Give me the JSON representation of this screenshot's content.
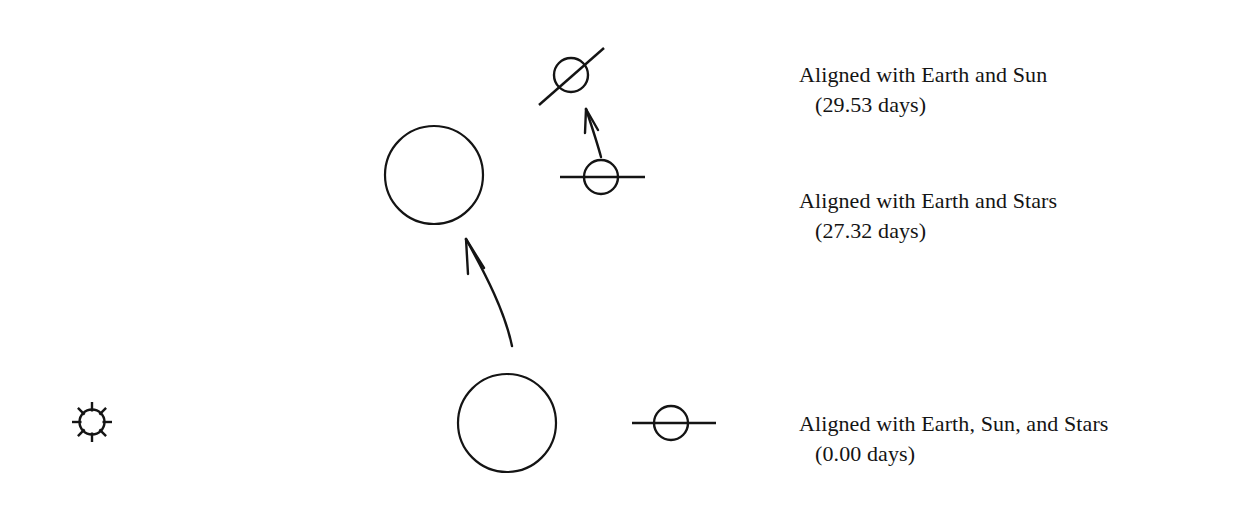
{
  "figure": {
    "background_color": "#ffffff",
    "stroke_color": "#141414"
  },
  "labels": {
    "synodic": {
      "line1": "Aligned with Earth and Sun",
      "line2": "(29.53 days)",
      "days": "29.53"
    },
    "sidereal": {
      "line1": "Aligned with Earth and Stars",
      "line2": "(27.32 days)",
      "days": "27.32"
    },
    "start": {
      "line1": "Aligned with Earth, Sun, and Stars",
      "line2": "(0.00 days)",
      "days": "0.00"
    }
  },
  "bodies": {
    "sun": {
      "name": "Sun",
      "cx": 92,
      "cy": 422,
      "r": 13,
      "rays": 8
    },
    "earth_start": {
      "name": "Earth at start",
      "cx": 507,
      "cy": 423,
      "r": 49
    },
    "earth_later": {
      "name": "Earth one month later",
      "cx": 434,
      "cy": 175,
      "r": 49
    },
    "moon_start": {
      "name": "Moon aligned with Earth, Sun, and Stars",
      "cx": 671,
      "cy": 423,
      "r": 17,
      "marker": "horizontal-line",
      "angle_deg": 0
    },
    "moon_sidereal": {
      "name": "Moon aligned with Earth and Stars",
      "cx": 601,
      "cy": 177,
      "r": 17,
      "marker": "horizontal-line",
      "angle_deg": 0
    },
    "moon_synodic": {
      "name": "Moon aligned with Earth and Sun",
      "cx": 571,
      "cy": 75,
      "r": 17,
      "marker": "diagonal-line",
      "angle_deg": -41
    }
  },
  "arrows": {
    "earth_orbit": {
      "name": "Earth orbital motion arrow",
      "from_x": 512,
      "from_y": 345,
      "to_x": 465,
      "to_y": 238
    },
    "moon_orbit": {
      "name": "Moon extra orbital motion arrow",
      "from_x": 601,
      "from_y": 156,
      "to_x": 586,
      "to_y": 108
    }
  }
}
